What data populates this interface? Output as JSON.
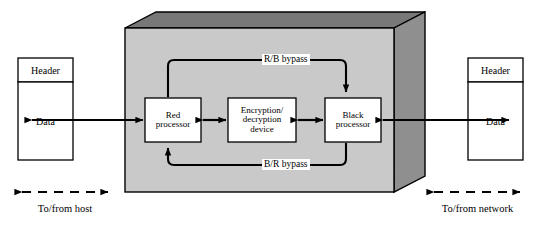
{
  "diagram": {
    "colors": {
      "enclosure_front": "#c9c9c9",
      "enclosure_top": "#787878",
      "enclosure_side": "#8f8f8f",
      "stroke": "#000000",
      "box_fill": "#ffffff",
      "background": "#ffffff"
    },
    "left_packet": {
      "name": "host-side-packet",
      "header_label": "Header",
      "data_label": "Data"
    },
    "right_packet": {
      "name": "network-side-packet",
      "header_label": "Header",
      "data_label": "Data"
    },
    "processors": [
      {
        "id": "red-processor",
        "line1": "Red",
        "line2": "processor"
      },
      {
        "id": "encryption-device",
        "line1": "Encryption/",
        "line2": "decryption",
        "line3": "device"
      },
      {
        "id": "black-processor",
        "line1": "Black",
        "line2": "processor"
      }
    ],
    "bypasses": [
      {
        "id": "rb-bypass",
        "label": "R/B bypass",
        "direction": "red-to-black"
      },
      {
        "id": "br-bypass",
        "label": "B/R bypass",
        "direction": "black-to-red"
      }
    ],
    "footer": {
      "left_label": "To/from host",
      "right_label": "To/from network"
    }
  }
}
